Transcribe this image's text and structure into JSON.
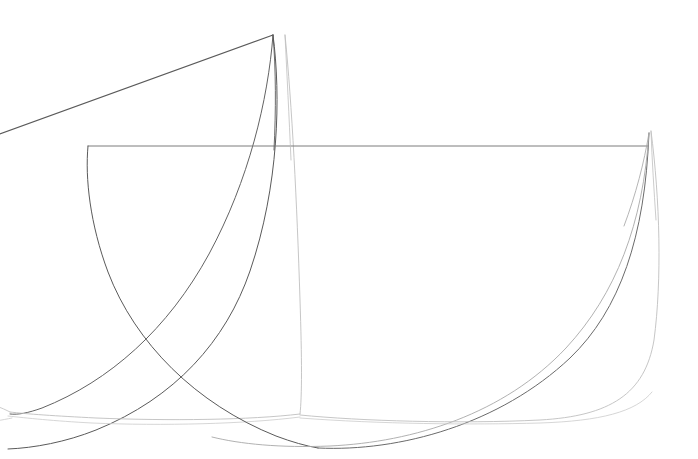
{
  "document": {
    "title": "Abstract Line Drawing",
    "kind": "vector-line-art",
    "background_color": "#ffffff",
    "width": 698,
    "height": 459
  },
  "palette": {
    "dark_gray": "#5a5a5a",
    "mid_gray": "#7d7d7d",
    "light_gray": "#a8a8a8",
    "pale_gray": "#bfbfbf",
    "very_pale_gray": "#cccccc",
    "background": "#ffffff"
  },
  "figure": {
    "shapes": [
      {
        "id": "left-sail",
        "label": "Left petal outline",
        "apex": [
          273,
          35
        ],
        "color_key": "dark_gray",
        "stroke_width": 0.9
      },
      {
        "id": "right-sail",
        "label": "Right petal outline",
        "apex": [
          649,
          133
        ],
        "color_key": "light_gray",
        "stroke_width": 0.9
      }
    ],
    "anchors": {
      "left_edge_exit": [
        0,
        132
      ],
      "upper_apex": [
        273,
        35
      ],
      "upper_apex_secondary": [
        285,
        35
      ],
      "chord_left_corner": [
        88,
        146
      ],
      "chord_right_corner": [
        648,
        146
      ],
      "right_apex": [
        651,
        131
      ],
      "crossing_left": [
        145,
        355
      ],
      "bottom_cusp_left": [
        12,
        412
      ],
      "bottom_cusp_mid": [
        300,
        416
      ],
      "bottom_low_right": [
        600,
        417
      ]
    }
  },
  "paths": [
    {
      "name": "upper-straight-chord",
      "d": "M -6 136 L 273 35",
      "color_key": "dark_gray",
      "width": 1.1,
      "opacity": 1
    },
    {
      "name": "left-sail-outer-curve",
      "d": "M 273 35 C 281 96, 279 186, 250 271 C 226 341, 175 398, 96 430 C 66 442, 34 448, 8 449",
      "color_key": "dark_gray",
      "width": 1.0,
      "opacity": 1
    },
    {
      "name": "left-sail-inner-curve",
      "d": "M 273 35 C 268 100, 249 180, 209 254 C 168 329, 110 381, 42 408 C 28 413, 18 415, 10 414",
      "color_key": "dark_gray",
      "width": 1.0,
      "opacity": 0.95
    },
    {
      "name": "left-sail-pale-curve",
      "d": "M 285 35 C 292 104, 297 204, 300 300 C 302 360, 302 396, 300 414",
      "color_key": "pale_gray",
      "width": 0.9,
      "opacity": 1
    },
    {
      "name": "left-sail-bottom-return",
      "d": "M 300 414 C 250 420, 170 421, 96 418 C 56 416, 26 414, 10 412",
      "color_key": "pale_gray",
      "width": 0.9,
      "opacity": 1
    },
    {
      "name": "left-sail-bottom-return-2",
      "d": "M 300 417 C 246 424, 162 426, 92 423 C 54 421, 26 418, 8 416",
      "color_key": "very_pale_gray",
      "width": 0.8,
      "opacity": 1
    },
    {
      "name": "horizontal-chord",
      "d": "M 88 146 L 648 146",
      "color_key": "mid_gray",
      "width": 1.0,
      "opacity": 1
    },
    {
      "name": "right-sail-left-curve",
      "d": "M 88 146 C 85 178, 90 224, 108 272 C 135 343, 196 404, 276 436 C 292 442, 306 446, 318 448",
      "color_key": "dark_gray",
      "width": 1.0,
      "opacity": 1
    },
    {
      "name": "right-sail-left-curve-to-apex",
      "d": "M 318 448 C 400 452, 500 424, 570 358 C 620 310, 645 237, 649 133",
      "color_key": "dark_gray",
      "width": 1.0,
      "opacity": 0.9
    },
    {
      "name": "right-sail-inner-curve",
      "d": "M 649 133 C 643 224, 616 294, 566 348 C 504 414, 414 442, 330 446 C 280 448, 240 444, 212 437",
      "color_key": "light_gray",
      "width": 0.9,
      "opacity": 1
    },
    {
      "name": "right-sail-outer-curve",
      "d": "M 651 131 C 660 200, 662 280, 654 340 C 645 394, 610 416, 540 420 C 460 424, 360 421, 300 415",
      "color_key": "pale_gray",
      "width": 0.9,
      "opacity": 1
    },
    {
      "name": "right-sail-lower-chord",
      "d": "M 300 418 C 380 424, 470 425, 540 423 C 600 421, 636 412, 652 392",
      "color_key": "very_pale_gray",
      "width": 0.8,
      "opacity": 1
    },
    {
      "name": "apex-thin-stem-left",
      "d": "M 273 35 C 276 70, 276 110, 274 150",
      "color_key": "dark_gray",
      "width": 0.9,
      "opacity": 1
    },
    {
      "name": "apex-thin-stem-right",
      "d": "M 285 35 C 287 75, 289 115, 291 160",
      "color_key": "pale_gray",
      "width": 0.8,
      "opacity": 1
    },
    {
      "name": "right-apex-stem",
      "d": "M 651 131 C 652 160, 654 190, 656 220",
      "color_key": "pale_gray",
      "width": 0.8,
      "opacity": 1
    },
    {
      "name": "right-apex-stem-inner",
      "d": "M 649 133 C 644 163, 636 194, 624 226",
      "color_key": "light_gray",
      "width": 0.85,
      "opacity": 1
    },
    {
      "name": "bottom-left-whisker",
      "d": "M 10 412 C 6 410, 2 408, -4 406",
      "color_key": "pale_gray",
      "width": 0.8,
      "opacity": 1
    },
    {
      "name": "bottom-left-whisker-2",
      "d": "M 12 418 C 7 419, 2 420, -4 421",
      "color_key": "very_pale_gray",
      "width": 0.8,
      "opacity": 1
    }
  ]
}
